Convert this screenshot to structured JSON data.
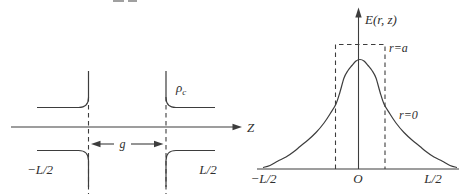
{
  "colors": {
    "line": "#3d3d3d",
    "text": "#2e2e2e",
    "background": "#ffffff"
  },
  "left_panel": {
    "axis_label": "Z",
    "gap_label": "g",
    "charge_label": {
      "symbol": "ρ",
      "subscript": "c"
    },
    "left_boundary_label": "−L/2",
    "right_boundary_label": "L/2"
  },
  "right_panel": {
    "axis_label": "E(r, z)",
    "aperture_curve_label": "r=a",
    "axis_curve_label": "r=0",
    "left_boundary_label": "−L/2",
    "origin_label": "O",
    "right_boundary_label": "L/2"
  },
  "chart_data": {
    "type": "line",
    "title": "",
    "xlabel": "z",
    "ylabel": "E(r, z)",
    "x_tick_labels": [
      "−L/2",
      "O",
      "L/2"
    ],
    "legend_position": "inline-annotations",
    "grid": false,
    "series": [
      {
        "name": "r=0",
        "shape": "bell curve, steep shoulders at gap edges, peak at z=0"
      },
      {
        "name": "r=a",
        "shape": "dashed rectangle spanning the gap, height above bell peak"
      }
    ],
    "render": {
      "baseline_y": 169,
      "rect": {
        "x1": 335.5,
        "x2": 385,
        "top": 44.5
      },
      "bell_points": [
        [
          263,
          167.5
        ],
        [
          270,
          165.5
        ],
        [
          278,
          161
        ],
        [
          286,
          157
        ],
        [
          294,
          151.5
        ],
        [
          300,
          146.5
        ],
        [
          308,
          140
        ],
        [
          316,
          132.5
        ],
        [
          324,
          123
        ],
        [
          330,
          114
        ],
        [
          336,
          104
        ],
        [
          340,
          92
        ],
        [
          344,
          78
        ],
        [
          348,
          70.5
        ],
        [
          352,
          65.5
        ],
        [
          356,
          61
        ],
        [
          360,
          59.5
        ],
        [
          364,
          61
        ],
        [
          368,
          65.5
        ],
        [
          372,
          70.5
        ],
        [
          376,
          78
        ],
        [
          380,
          92
        ],
        [
          384,
          104
        ],
        [
          390,
          114
        ],
        [
          396,
          123
        ],
        [
          404,
          132.5
        ],
        [
          412,
          140
        ],
        [
          420,
          146.5
        ],
        [
          426,
          151.5
        ],
        [
          434,
          157
        ],
        [
          442,
          161
        ],
        [
          450,
          165.5
        ],
        [
          457,
          167.5
        ]
      ]
    }
  }
}
